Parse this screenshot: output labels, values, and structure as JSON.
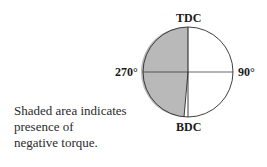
{
  "diagram": {
    "labels": {
      "top": "TDC",
      "bottom": "BDC",
      "left": "270°",
      "right": "90°"
    },
    "caption_lines": [
      "Shaded area indicates",
      "presence of",
      "negative torque."
    ],
    "colors": {
      "shaded": "#b9b9b9",
      "stroke": "#2a2a2a",
      "background": "#ffffff"
    }
  }
}
